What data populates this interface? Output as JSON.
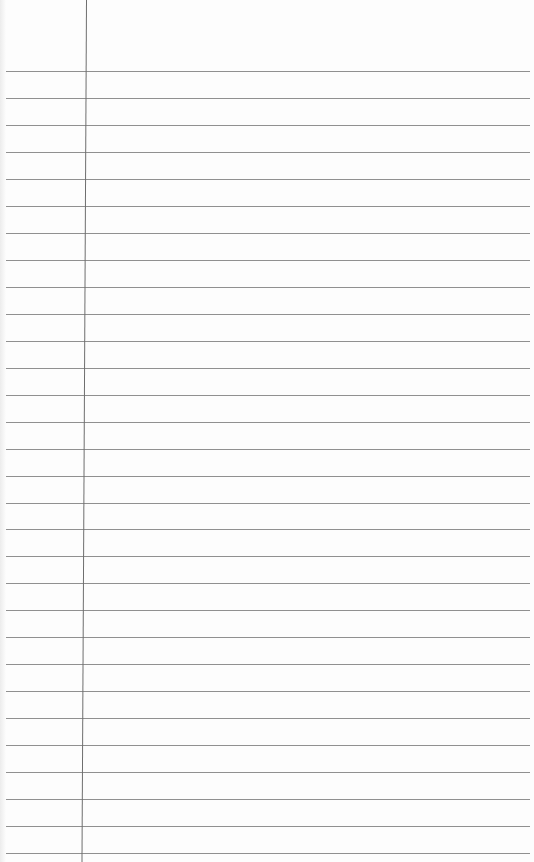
{
  "page": {
    "type": "lined-notepaper",
    "background": "#fdfdfd",
    "rule_color": "#7d7d7d",
    "margin_color": "#6e6e6e",
    "rule_count": 30,
    "first_rule_y": 71,
    "rule_spacing": 26.97,
    "margin_x": 86
  }
}
